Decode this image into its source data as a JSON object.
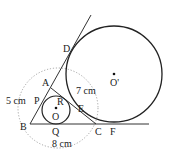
{
  "diagram": {
    "type": "geometry",
    "points": {
      "A": {
        "label": "A",
        "x": 51,
        "y": 87
      },
      "B": {
        "label": "B",
        "x": 30,
        "y": 124
      },
      "C": {
        "label": "C",
        "x": 96,
        "y": 124
      },
      "D": {
        "label": "D",
        "x": 71,
        "y": 54
      },
      "E": {
        "label": "E",
        "x": 84,
        "y": 104
      },
      "F": {
        "label": "F",
        "x": 114,
        "y": 124
      },
      "P": {
        "label": "P",
        "x": 40,
        "y": 104
      },
      "Q": {
        "label": "Q",
        "x": 56,
        "y": 124
      },
      "R": {
        "label": "R",
        "x": 62,
        "y": 99
      },
      "O": {
        "label": "O",
        "x": 56,
        "y": 110
      },
      "O_prime": {
        "label": "O'",
        "x": 114,
        "y": 74
      }
    },
    "circles": {
      "incircle": {
        "cx": 56,
        "cy": 110,
        "r": 14
      },
      "excircle": {
        "cx": 114,
        "cy": 74,
        "r": 48
      },
      "dotted": {
        "cx": 56,
        "cy": 110,
        "r": 43
      }
    },
    "measurements": {
      "AB": "5 cm",
      "AC": "7 cm",
      "BC": "8 cm"
    },
    "colors": {
      "line": "#333333",
      "dotted": "#999999",
      "text": "#222222"
    }
  }
}
